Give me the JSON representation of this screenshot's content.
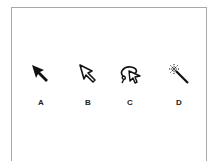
{
  "figure": {
    "tools": [
      {
        "label": "A",
        "icon": "selection-arrow-filled-icon"
      },
      {
        "label": "B",
        "icon": "direct-selection-arrow-outline-icon"
      },
      {
        "label": "C",
        "icon": "lasso-select-icon"
      },
      {
        "label": "D",
        "icon": "magic-wand-icon"
      }
    ]
  }
}
